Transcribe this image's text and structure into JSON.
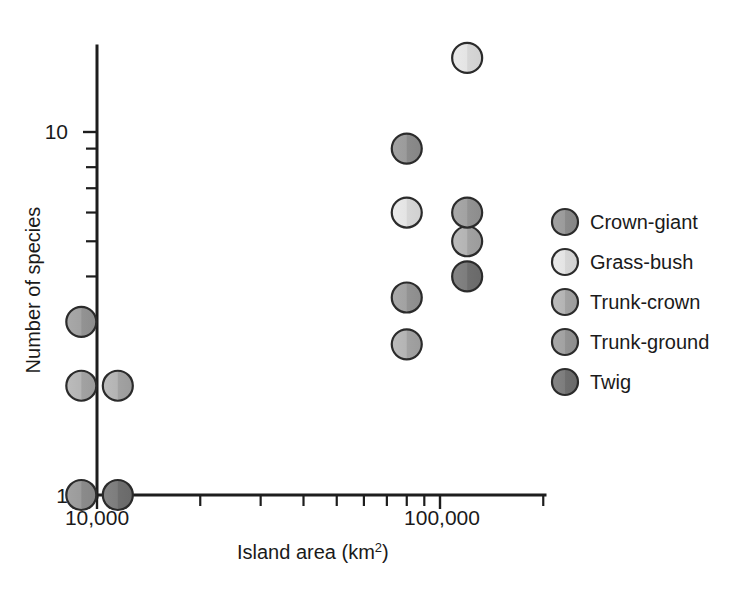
{
  "figure": {
    "background_color": "#ffffff",
    "axis_color": "#1d1d1d",
    "text_color": "#1a1a1a"
  },
  "axes": {
    "x_title_main": "Island area (km",
    "x_title_sup": "2",
    "x_title_close": ")",
    "x_title_full": "Island area (km2)",
    "y_title": "Number of species",
    "x_tick_labels": [
      "10,000",
      "100,000"
    ],
    "y_tick_labels": [
      "1",
      "10"
    ],
    "x_scale": "log10",
    "y_scale": "log10"
  },
  "legend": {
    "items": [
      {
        "label": "Crown-giant",
        "color": "#949494",
        "color_left": "#9a9a9a",
        "color_right": "#8c8c8c",
        "icon": "circle-marker-icon"
      },
      {
        "label": "Grass-bush",
        "color": "#e0e0e0",
        "color_left": "#e6e6e6",
        "color_right": "#d8d8d8",
        "icon": "circle-marker-icon"
      },
      {
        "label": "Trunk-crown",
        "color": "#ababab",
        "color_left": "#b2b2b2",
        "color_right": "#a3a3a3",
        "icon": "circle-marker-icon"
      },
      {
        "label": "Trunk-ground",
        "color": "#9d9d9d",
        "color_left": "#a4a4a4",
        "color_right": "#959595",
        "icon": "circle-marker-icon"
      },
      {
        "label": "Twig",
        "color": "#787878",
        "color_left": "#7e7e7e",
        "color_right": "#717171",
        "icon": "circle-marker-icon"
      }
    ]
  },
  "chart_data": {
    "type": "scatter",
    "title": "",
    "xlabel": "Island area (km2)",
    "ylabel": "Number of species",
    "xscale": "log",
    "yscale": "log",
    "xlim": [
      8500,
      260000
    ],
    "ylim": [
      1,
      20
    ],
    "grid": false,
    "legend_position": "right",
    "x_ticks": [
      10000,
      100000
    ],
    "x_tick_labels": [
      "10,000",
      "100,000"
    ],
    "x_minor_ticks": [
      20000,
      30000,
      40000,
      50000,
      60000,
      70000,
      80000,
      90000,
      200000
    ],
    "y_ticks": [
      1,
      10
    ],
    "y_tick_labels": [
      "1",
      "10"
    ],
    "y_minor_ticks": [
      2,
      3,
      4,
      5,
      6,
      7,
      8,
      9
    ],
    "series": [
      {
        "name": "Crown-giant",
        "color": "#949494",
        "points": [
          {
            "x": 9000,
            "y": 1,
            "island": "Puerto Rico"
          },
          {
            "x": 80000,
            "y": 9,
            "island": "Cuba"
          }
        ]
      },
      {
        "name": "Grass-bush",
        "color": "#e0e0e0",
        "points": [
          {
            "x": 80000,
            "y": 6,
            "island": "Cuba"
          },
          {
            "x": 120000,
            "y": 16,
            "island": "Hispaniola"
          }
        ]
      },
      {
        "name": "Trunk-crown",
        "color": "#ababab",
        "points": [
          {
            "x": 9000,
            "y": 2,
            "island": "Jamaica"
          },
          {
            "x": 11500,
            "y": 2,
            "island": "Puerto Rico"
          },
          {
            "x": 80000,
            "y": 2.6,
            "island": "Cuba"
          },
          {
            "x": 120000,
            "y": 5,
            "island": "Hispaniola"
          }
        ]
      },
      {
        "name": "Trunk-ground",
        "color": "#9d9d9d",
        "points": [
          {
            "x": 9000,
            "y": 3,
            "island": "Jamaica"
          },
          {
            "x": 80000,
            "y": 3.5,
            "island": "Cuba"
          },
          {
            "x": 120000,
            "y": 6,
            "island": "Hispaniola"
          }
        ]
      },
      {
        "name": "Twig",
        "color": "#787878",
        "points": [
          {
            "x": 11500,
            "y": 1,
            "island": "Jamaica"
          },
          {
            "x": 120000,
            "y": 4,
            "island": "Hispaniola"
          }
        ]
      }
    ]
  },
  "plot_geometry": {
    "comment": "pixel anchors used to reproduce the original rendering",
    "x_axis_y": 495,
    "y_axis_x": 97,
    "x_10000_px": 97,
    "x_100000_px": 440,
    "y_1_px": 495,
    "y_10_px": 132,
    "marker_radius": 15,
    "legend_x_marker": 565,
    "legend_x_text": 590,
    "legend_y_start": 222,
    "legend_row_step": 40,
    "legend_marker_radius": 13
  }
}
